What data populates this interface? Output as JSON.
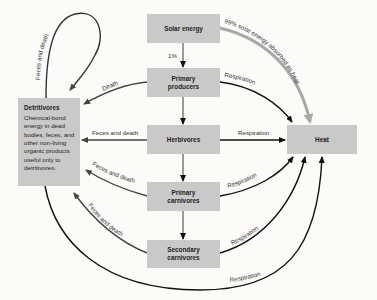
{
  "nodes": {
    "solar": {
      "label": "Solar energy"
    },
    "primary_producers": {
      "label": "Primary producers",
      "line1": "Primary",
      "line2": "producers"
    },
    "herbivores": {
      "label": "Herbivores"
    },
    "primary_carnivores": {
      "label": "Primary carnivores",
      "line1": "Primary",
      "line2": "carnivores"
    },
    "secondary_carnivores": {
      "label": "Secondary carnivores",
      "line1": "Secondary",
      "line2": "carnivores"
    },
    "heat": {
      "label": "Heat"
    },
    "detritivores": {
      "title": "Detritivores",
      "description": "Chemical-bond energy in dead bodies, feces, and other non-living organic products useful only to detritivores."
    }
  },
  "edges": {
    "solar_to_producers": "1%",
    "solar_to_heat": "99% solar energy absorbed as heat",
    "producers_to_heat": "Respiration",
    "herbivores_to_heat": "Respiration",
    "primary_carnivores_to_heat": "Respiration",
    "secondary_carnivores_to_heat": "Respiration",
    "detritivores_to_heat": "Respiration",
    "producers_to_detritivores": "Death",
    "herbivores_to_detritivores": "Feces and death",
    "primary_carnivores_to_detritivores": "Feces and death",
    "secondary_carnivores_to_detritivores": "Feces and death",
    "detritivores_loop": "Feces and death"
  },
  "colors": {
    "box_fill": "#c9c9c9",
    "arrow": "#111111",
    "detritus_arrow": "#555555",
    "solar_heat_arrow": "#a8a8a8",
    "background": "#fbfbfa"
  }
}
